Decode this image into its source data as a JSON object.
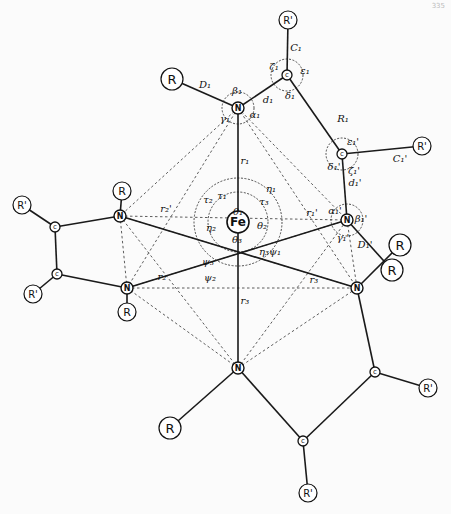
{
  "figure": {
    "page_number": "335",
    "center_atom": "Fe",
    "atom_labels": {
      "nitrogen": "N",
      "carbon": "c",
      "substituent_R": "R",
      "substituent_R_prime": "R'"
    }
  },
  "bond_labels": {
    "r1": "r₁",
    "r1p": "r₁'",
    "r2": "r₂",
    "r2p": "r₂'",
    "r3": "r₃",
    "r3p": "r₃'",
    "D1": "D₁",
    "D1p": "D₁'",
    "d1": "d₁",
    "d1p": "d₁'",
    "C1": "C₁",
    "C1p": "C₁'",
    "R1": "R₁"
  },
  "angle_labels": {
    "alpha1": "α₁",
    "alpha1p": "α₁'",
    "beta1": "β₁",
    "beta1p": "β₁'",
    "gamma1": "γ₁",
    "gamma1p": "γ₁'",
    "delta1": "δ₁",
    "delta1p": "δ₁'",
    "epsilon1": "ε₁",
    "epsilon1p": "ε₁'",
    "zeta1": "ζ₁",
    "zeta1p": "ζ₁'",
    "theta1": "θ₁",
    "theta2": "θ₂",
    "theta3": "θ₃",
    "tau1": "τ₁",
    "tau2": "τ₂",
    "tau3": "τ₃",
    "eta1": "η₁",
    "eta2": "η₂",
    "eta3": "η₃",
    "psi1": "ψ₁",
    "psi2": "ψ₂",
    "psi3": "ψ₃"
  }
}
